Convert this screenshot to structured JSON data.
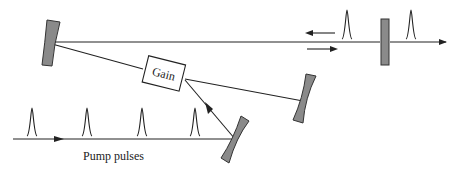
{
  "diagram": {
    "type": "laser-cavity-schematic",
    "gain_label": "Gain",
    "pump_label": "Pump pulses",
    "colors": {
      "line": "#222222",
      "mirror_fill": "#8a8a8a",
      "mirror_stroke": "#333333",
      "background": "#ffffff"
    },
    "elements": {
      "left_mirror": "curved mirror",
      "output_coupler": "flat output coupler",
      "fold_mirror": "curved mirror",
      "pump_mirror": "curved mirror",
      "gain_medium": "Gain"
    },
    "pump_pulse_count": 4,
    "intracavity_pulse_count": 1,
    "output_pulse_count": 1
  }
}
